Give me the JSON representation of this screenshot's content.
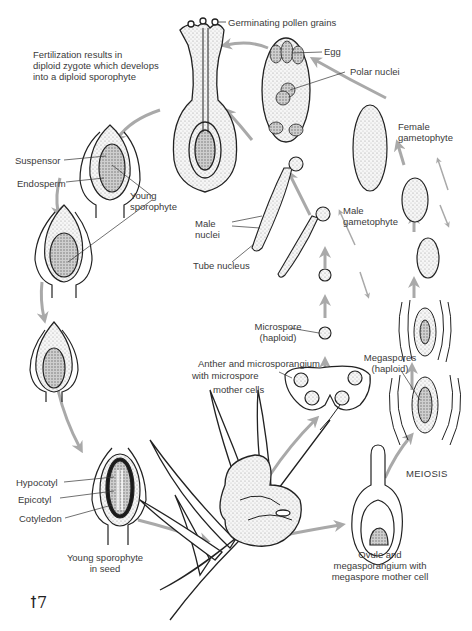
{
  "diagram": {
    "colors": {
      "arrow": "#a9a9a9",
      "ink": "#222222",
      "stipple": "#d8d8d8",
      "dark_stipple": "#9a9a9a",
      "text": "#3a3a3a"
    },
    "labels": {
      "pollen": "Germinating pollen grains",
      "fert_1": "Fertilization results in",
      "fert_2": "diploid zygote which develops",
      "fert_3": "into a diploid sporophyte",
      "egg": "Egg",
      "polar": "Polar nuclei",
      "female_1": "Female",
      "female_2": "gametophyte",
      "suspensor": "Suspensor",
      "endosperm": "Endosperm",
      "young_1": "Young",
      "young_2": "sporophyte",
      "male_nuc_1": "Male",
      "male_nuc_2": "nuclei",
      "male_gam_1": "Male",
      "male_gam_2": "gametophyte",
      "tube": "Tube nucleus",
      "micro_1": "Microspore",
      "micro_2": "(haploid)",
      "anther_1": "Anther and microsporangium",
      "anther_2": "with microspore",
      "anther_3": "mother cells",
      "mega_1": "Megaspores",
      "mega_2": "(haploid)",
      "meiosis": "MEIOSIS",
      "hypocotyl": "Hypocotyl",
      "epicotyl": "Epicotyl",
      "cotyledon": "Cotyledon",
      "seed_1": "Young sporophyte",
      "seed_2": "in seed",
      "ovule_1": "Ovule and",
      "ovule_2": "megasporangium with",
      "ovule_3": "megaspore mother cell",
      "signature": "ꝉ7"
    }
  }
}
